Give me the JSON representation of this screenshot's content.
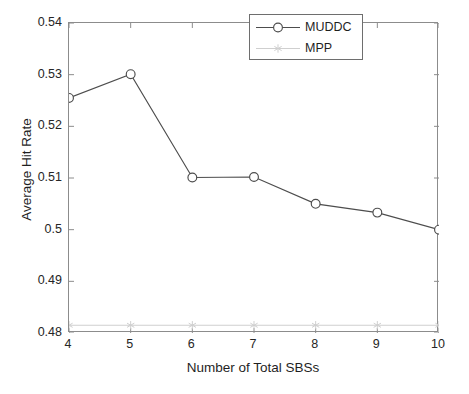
{
  "chart_data": {
    "type": "line",
    "title": "",
    "xlabel": "Number of Total SBSs",
    "ylabel": "Average Hit Rate",
    "x": [
      4,
      5,
      6,
      7,
      8,
      9,
      10
    ],
    "xlim": [
      4,
      10
    ],
    "ylim": [
      0.48,
      0.54
    ],
    "xticks": [
      "4",
      "5",
      "6",
      "7",
      "8",
      "9",
      "10"
    ],
    "yticks": [
      "0.48",
      "0.49",
      "0.5",
      "0.51",
      "0.52",
      "0.53",
      "0.54"
    ],
    "ytick_values": [
      0.48,
      0.49,
      0.5,
      0.51,
      0.52,
      0.53,
      0.54
    ],
    "grid": false,
    "legend_position": "upper right",
    "series": [
      {
        "name": "MUDDC",
        "marker": "circle",
        "color": "#4d4d4d",
        "values": [
          0.5255,
          0.5301,
          0.5101,
          0.5102,
          0.505,
          0.5033,
          0.5
        ]
      },
      {
        "name": "MPP",
        "marker": "star",
        "color": "#cfcfcf",
        "values": [
          0.4815,
          0.4815,
          0.4815,
          0.4815,
          0.4815,
          0.4815,
          0.4815
        ]
      }
    ]
  },
  "legend": {
    "entries": [
      {
        "label": "MUDDC"
      },
      {
        "label": "MPP"
      }
    ]
  },
  "icons": {
    "circle_marker": "circle-marker-icon",
    "star_marker": "star-marker-icon"
  }
}
